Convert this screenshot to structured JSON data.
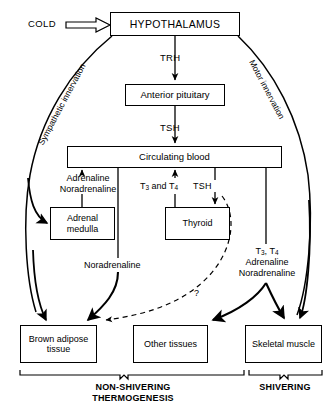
{
  "diagram": {
    "stimulus": {
      "label": "COLD"
    },
    "nodes": {
      "hypothalamus": "HYPOTHALAMUS",
      "anterior_pituitary": "Anterior pituitary",
      "circulating_blood": "Circulating blood",
      "adrenal_medulla": "Adrenal\nmedulla",
      "adrenal_medulla_line1": "Adrenal",
      "adrenal_medulla_line2": "medulla",
      "thyroid": "Thyroid",
      "brown_adipose_line1": "Brown adipose",
      "brown_adipose_line2": "tissue",
      "other_tissues": "Other tissues",
      "skeletal_muscle": "Skeletal muscle"
    },
    "edge_labels": {
      "trh": "TRH",
      "tsh_pituitary_to_blood": "TSH",
      "adrenaline": "Adrenaline",
      "noradrenaline": "Noradrenaline",
      "t3_and_t4": "T",
      "t3_and_t4_sub1": "3",
      "t3_and_t4_mid": " and T",
      "t3_and_t4_sub2": "4",
      "tsh_blood_to_thyroid": "TSH",
      "noradrenaline_mid": "Noradrenaline",
      "right_t3t4": "T",
      "right_t3_sub": "3",
      "right_t3t4_sep": ", T",
      "right_t4_sub": "4",
      "right_adrenaline": "Adrenaline",
      "right_noradrenaline": "Noradrenaline",
      "uncertain": "?",
      "sympathetic_innervation": "Sympathetic innervation",
      "motor_innervation": "Motor innervation"
    },
    "brackets": {
      "non_shivering_line1": "NON-SHIVERING",
      "non_shivering_line2": "THERMOGENESIS",
      "shivering": "SHIVERING"
    },
    "colors": {
      "stroke": "#000000",
      "background": "#ffffff",
      "text": "#000000"
    }
  }
}
